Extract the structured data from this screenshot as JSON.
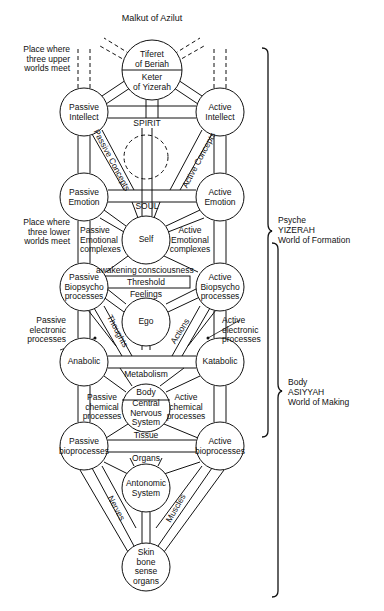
{
  "title": "Malkut of Azilut",
  "top_left_note": "Place where\nthree upper\nworlds meet",
  "mid_left_note": "Place where\nthree lower\nworlds meet",
  "nodes": {
    "tiferet": "Tiferet\nof Beriah",
    "keter": "Keter\nof Yizerah",
    "passive_intellect": "Passive\nIntellect",
    "active_intellect": "Active\nIntellect",
    "passive_emotion": "Passive\nEmotion",
    "active_emotion": "Active\nEmotion",
    "self": "Self",
    "passive_biopsycho": "Passive\nBiopsycho\nprocesses",
    "active_biopsycho": "Active\nBiopsycho\nprocesses",
    "ego": "Ego",
    "anabolic": "Anabolic",
    "katabolic": "Katabolic",
    "body_cns": "Central\nNervous\nSystem",
    "body": "Body",
    "passive_bio": "Passive\nbioprocesses",
    "active_bio": "Active\nbioprocesses",
    "antonomic": "Antonomic\nSystem",
    "skin": "Skin\nbone\nsense\norgans"
  },
  "path_labels": {
    "spirit": "SPIRIT",
    "soul": "SOUL",
    "passive_concepts": "Passive Concepts",
    "active_concepts": "Active Concepts",
    "passive_emotional_complexes": "Passive\nEmotional\ncomplexes",
    "active_emotional_complexes": "Active\nEmotional\ncomplexes",
    "awakening": "awakening",
    "consciousness": "consciousness",
    "threshold": "Threshold",
    "feelings": "Feelings",
    "thoughts": "Thoughts",
    "actions": "Actions",
    "passive_electronic": "Passive\nelectronic\nprocesses",
    "active_electronic": "Active\nelectronic\nprocesses",
    "metabolism": "Metabolism",
    "passive_chemical": "Passive\nchemical\nprocesses",
    "active_chemical": "Active\nchemical\nprocesses",
    "tissue": "Tissue",
    "organs": "Organs",
    "nerves": "Nerves",
    "muscles": "Muscles"
  },
  "braces": {
    "psyche": "Psyche\nYIZERAH\nWorld of Formation",
    "body": "Body\nASIYYAH\nWorld of Making"
  }
}
